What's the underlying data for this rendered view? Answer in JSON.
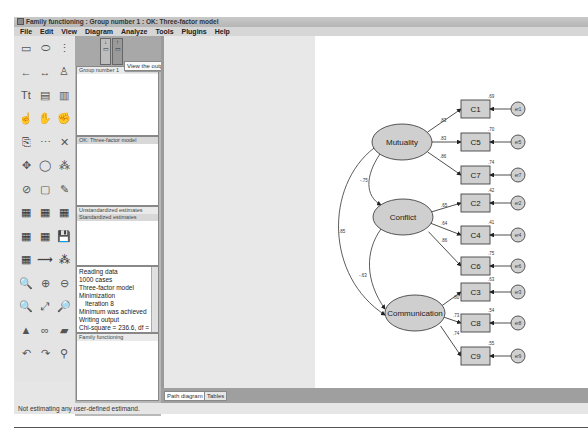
{
  "window": {
    "title": "Family functioning : Group number 1 : OK: Three-factor model"
  },
  "menu": [
    "File",
    "Edit",
    "View",
    "Diagram",
    "Analyze",
    "Tools",
    "Plugins",
    "Help"
  ],
  "toolbox": {
    "tools": [
      "draw-observed-icon",
      "draw-unobserved-icon",
      "draw-indicator-icon",
      "draw-path-icon",
      "draw-covariance-icon",
      "add-unique-variable-icon",
      "figure-caption-icon",
      "list-variables-model-icon",
      "list-variables-dataset-icon",
      "select-one-icon",
      "select-all-icon",
      "deselect-all-icon",
      "duplicate-icon",
      "move-icon",
      "erase-icon",
      "change-shape-icon",
      "rotate-indicators-icon",
      "reflect-indicators-icon",
      "move-parameters-icon",
      "scroll-icon",
      "touch-up-icon",
      "data-files-icon",
      "analysis-properties-icon",
      "calculate-estimates-icon",
      "view-text-icon",
      "copy-to-clipboard-icon",
      "save-icon",
      "object-properties-icon",
      "drag-properties-icon",
      "preserve-symmetries-icon",
      "zoom-selected-icon",
      "zoom-in-icon",
      "zoom-out-icon",
      "zoom-page-icon",
      "fit-to-page-icon",
      "loupe-icon",
      "bayesian-icon",
      "multiple-group-icon",
      "print-icon",
      "undo-icon",
      "redo-icon",
      "specification-search-icon"
    ]
  },
  "panels": {
    "view_input_tooltip": "View the output path diagram",
    "groups_header": "Group number 1",
    "models_header": "OK: Three-factor model",
    "estimates": [
      "Unstandardized estimates",
      "Standardized estimates"
    ],
    "log_lines": [
      "Reading data",
      "1000 cases",
      "Three-factor model",
      "Minimization",
      "  Iteration 8",
      "Minimum was achieved",
      "Writing output",
      "Chi-square = 236.6, df = 24"
    ],
    "files_header": "Family functioning"
  },
  "tabs": {
    "path_diagram": "Path diagram",
    "tables": "Tables"
  },
  "status": "Not estimating any user-defined estimand.",
  "diagram": {
    "latents": [
      {
        "name": "Mutuality"
      },
      {
        "name": "Conflict"
      },
      {
        "name": "Communication"
      }
    ],
    "observed": [
      {
        "name": "C1",
        "r2": ".69",
        "loading": ".83",
        "error": "er1",
        "factor": 0
      },
      {
        "name": "C5",
        "r2": ".70",
        "loading": ".83",
        "error": "er5",
        "factor": 0
      },
      {
        "name": "C7",
        "r2": ".74",
        "loading": ".86",
        "error": "er7",
        "factor": 0
      },
      {
        "name": "C2",
        "r2": ".42",
        "loading": ".65",
        "error": "er2",
        "factor": 1
      },
      {
        "name": "C4",
        "r2": ".41",
        "loading": ".64",
        "error": "er4",
        "factor": 1
      },
      {
        "name": "C6",
        "r2": ".75",
        "loading": ".86",
        "error": "er6",
        "factor": 1
      },
      {
        "name": "C3",
        "r2": ".63",
        "loading": ".80",
        "error": "er3",
        "factor": 2
      },
      {
        "name": "C8",
        "r2": ".54",
        "loading": ".73",
        "error": "er8",
        "factor": 2
      },
      {
        "name": "C9",
        "r2": ".55",
        "loading": ".74",
        "error": "er9",
        "factor": 2
      }
    ],
    "covariances": [
      {
        "from": 0,
        "to": 1,
        "value": "-.75"
      },
      {
        "from": 1,
        "to": 2,
        "value": "-.63"
      },
      {
        "from": 0,
        "to": 2,
        "value": ".85"
      }
    ]
  }
}
